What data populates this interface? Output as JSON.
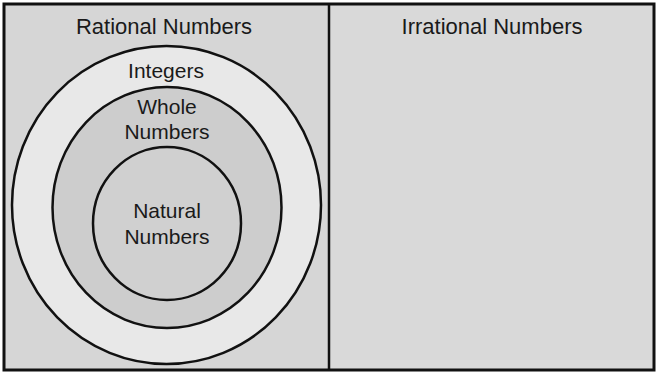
{
  "diagram": {
    "type": "venn-nested-sets",
    "regions": {
      "rational": {
        "label": "Rational Numbers",
        "fill": "#d6d6d6"
      },
      "irrational": {
        "label": "Irrational Numbers",
        "fill": "#d9d9d9"
      },
      "integers": {
        "label": "Integers",
        "fill": "#e8e8e8"
      },
      "whole": {
        "label_line1": "Whole",
        "label_line2": "Numbers",
        "fill": "#cdcdcd"
      },
      "natural": {
        "label_line1": "Natural",
        "label_line2": "Numbers",
        "fill": "#d0d0d0"
      }
    },
    "colors": {
      "stroke": "#111111",
      "text": "#1a1a1a"
    },
    "nesting": [
      "Natural Numbers",
      "Whole Numbers",
      "Integers",
      "Rational Numbers"
    ]
  }
}
